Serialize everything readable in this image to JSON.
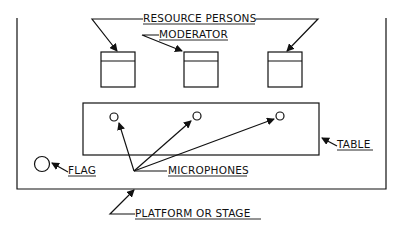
{
  "diagram": {
    "type": "seating-layout",
    "labels": {
      "resource_persons": "RESOURCE PERSONS",
      "moderator": "MODERATOR",
      "table": "TABLE",
      "flag": "FLAG",
      "microphones": "MICROPHONES",
      "platform": "PLATFORM OR STAGE"
    },
    "colors": {
      "stroke": "#111111",
      "background": "#ffffff"
    }
  }
}
